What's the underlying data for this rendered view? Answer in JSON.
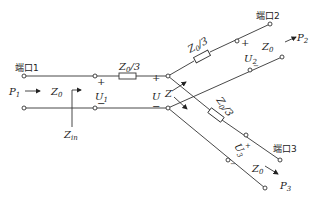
{
  "diagram": {
    "type": "three-port resistive power divider (star network)",
    "ports": [
      {
        "id": "port1",
        "label": "端口1",
        "power": "P",
        "power_sub": "1",
        "impedance": "Z",
        "impedance_sub": "0",
        "voltage": "U",
        "voltage_sub": "1"
      },
      {
        "id": "port2",
        "label": "端口2",
        "power": "P",
        "power_sub": "2",
        "impedance": "Z",
        "impedance_sub": "0",
        "voltage": "U",
        "voltage_sub": "2"
      },
      {
        "id": "port3",
        "label": "端口3",
        "power": "P",
        "power_sub": "3",
        "impedance": "Z",
        "impedance_sub": "0",
        "voltage": "U",
        "voltage_sub": "3"
      }
    ],
    "resistors": [
      {
        "id": "r1",
        "label": "Z",
        "sub": "0",
        "suffix": "/3"
      },
      {
        "id": "r2",
        "label": "Z",
        "sub": "0",
        "suffix": "/3"
      },
      {
        "id": "r3",
        "label": "Z",
        "sub": "0",
        "suffix": "/3"
      }
    ],
    "junction": {
      "voltage": "U",
      "impedance": "Z"
    },
    "input_impedance": {
      "label": "Z",
      "sub": "in"
    },
    "polarity": {
      "plus": "+",
      "minus": "−"
    }
  }
}
